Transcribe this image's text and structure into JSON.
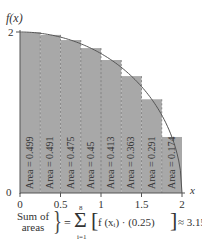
{
  "chart_data": {
    "type": "bar",
    "title": "",
    "xlabel": "x",
    "ylabel": "f(x)",
    "xlim": [
      0,
      2
    ],
    "ylim": [
      0,
      2
    ],
    "x_ticks": [
      "0",
      "0.5",
      "1",
      "1.5",
      "2"
    ],
    "y_ticks": [
      "0",
      "2"
    ],
    "function": "f(x) = sqrt(4 - x^2)",
    "bar_width": 0.25,
    "categories": [
      "[0,0.25]",
      "[0.25,0.5]",
      "[0.5,0.75]",
      "[0.75,1]",
      "[1,1.25]",
      "[1.25,1.5]",
      "[1.5,1.75]",
      "[1.75,2]"
    ],
    "bar_left_edges": [
      0,
      0.25,
      0.5,
      0.75,
      1.0,
      1.25,
      1.5,
      1.75
    ],
    "values": [
      1.996,
      1.964,
      1.9,
      1.8,
      1.652,
      1.452,
      1.164,
      0.696
    ],
    "bar_labels": [
      "Area = 0.499",
      "Area = 0.491",
      "Area = 0.475",
      "Area = 0.45",
      "Area = 0.413",
      "Area = 0.363",
      "Area = 0.291",
      "Area = 0.174"
    ],
    "grid": false,
    "legend": null,
    "annotation": "Sum of areas = Σ_{i=1}^{8} [f(x_i) · (0.25)] ≈ 3.156"
  },
  "axes": {
    "y_label": "f(x)",
    "x_label": "x",
    "y_tick_top": "2",
    "origin": "0"
  },
  "formula": {
    "sum_label_line1": "Sum of",
    "sum_label_line2": "areas",
    "brace": "}",
    "equals": "=",
    "sigma": "Σ",
    "upper": "8",
    "lower": "i=1",
    "bracket_open": "[",
    "expression": "f (xᵢ) · (0.25)",
    "bracket_close": "]",
    "result": "≈ 3.156"
  },
  "colors": {
    "bar_fill": "#a8a8a8",
    "bar_divider": "#7a7a7a",
    "curve": "#555555",
    "axis": "#555555"
  }
}
